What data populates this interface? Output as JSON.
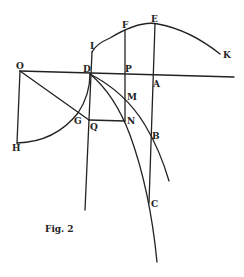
{
  "figure": {
    "caption": "Fig. 2",
    "labels": {
      "O": "O",
      "D": "D",
      "P": "P",
      "A": "A",
      "I": "I",
      "F": "F",
      "E": "E",
      "K": "K",
      "M": "M",
      "N": "N",
      "Q": "Q",
      "G": "G",
      "H": "H",
      "B": "B",
      "C": "C"
    },
    "points": {
      "O": [
        20,
        71
      ],
      "H": [
        17,
        143
      ],
      "D": [
        90,
        74
      ],
      "I": [
        92,
        52
      ],
      "F": [
        125,
        30
      ],
      "E": [
        155,
        24
      ],
      "K": [
        220,
        54
      ],
      "P": [
        125,
        75
      ],
      "A": [
        153,
        77
      ],
      "M": [
        125,
        97
      ],
      "N": [
        125,
        121
      ],
      "Q": [
        89,
        120
      ],
      "G": [
        78,
        113
      ],
      "B": [
        151,
        137
      ],
      "C": [
        149,
        203
      ]
    },
    "ink_color": "#222222",
    "background": "#ffffff"
  }
}
